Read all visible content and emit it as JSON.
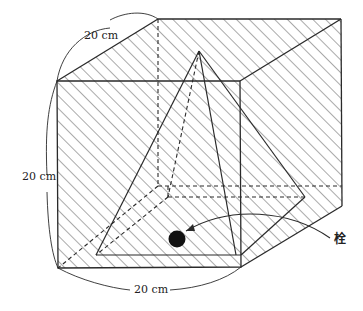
{
  "figure": {
    "labels": {
      "depth": "20 cm",
      "height": "20 cm",
      "width": "20 cm",
      "plug": "栓"
    },
    "colors": {
      "line": "#2a2a2a",
      "hatch": "#555555",
      "plug": "#111111",
      "background": "#ffffff"
    }
  }
}
